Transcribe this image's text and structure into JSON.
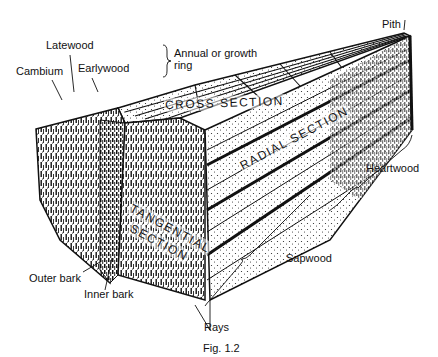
{
  "figure": {
    "caption": "Fig. 1.2"
  },
  "sections": {
    "cross": "CROSS SECTION",
    "radial": "RADIAL SECTION",
    "tangential_line1": "TANGENTIAL",
    "tangential_line2": "SECTION"
  },
  "labels": {
    "latewood": "Latewood",
    "cambium": "Cambium",
    "earlywood": "Earlywood",
    "annual_ring_line1": "Annual or growth",
    "annual_ring_line2": "ring",
    "pith": "Pith",
    "heartwood": "Heartwood",
    "sapwood": "Sapwood",
    "outer_bark": "Outer bark",
    "inner_bark": "Inner bark",
    "rays": "Rays"
  },
  "colors": {
    "ink": "#111111",
    "paper": "#ffffff"
  }
}
